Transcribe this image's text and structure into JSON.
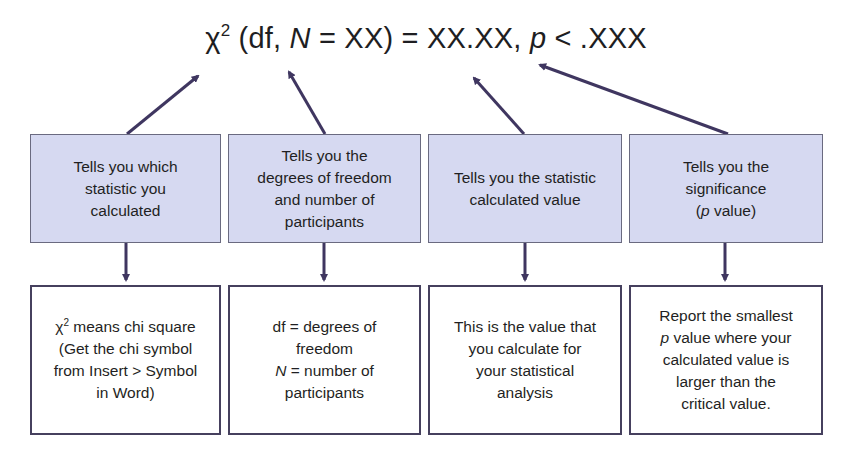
{
  "formula": {
    "chi": "χ",
    "sup": "2",
    "part1": " (df, ",
    "n_var": "N",
    "part2": " = XX) = XX.XX, ",
    "p_var": "p",
    "part3": " < .XXX"
  },
  "colors": {
    "arrow": "#3f3660",
    "top_box_fill": "#d6d9f1",
    "top_box_border": "#6a6a80",
    "bottom_box_border": "#46405e"
  },
  "top_boxes": [
    {
      "text": "Tells you which\nstatistic you\ncalculated"
    },
    {
      "text": "Tells you the\ndegrees of freedom\nand number of\nparticipants"
    },
    {
      "text": "Tells you the statistic\ncalculated value"
    },
    {
      "line1": "Tells you the",
      "line2": "significance",
      "paren_open": "(",
      "p_var": "p",
      "paren_rest": " value)"
    }
  ],
  "bottom_boxes": [
    {
      "chi": "χ",
      "sup": "2",
      "line1_rest": " means chi square",
      "rest": "(Get the chi symbol\nfrom Insert > Symbol\nin Word)"
    },
    {
      "line1": "df = degrees of",
      "line2": "freedom",
      "n_var": "N",
      "line3_rest": " = number of",
      "line4": "participants"
    },
    {
      "text": "This is the value that\nyou calculate for\nyour statistical\nanalysis"
    },
    {
      "line1": "Report the smallest",
      "p_var": "p",
      "line2_rest": " value where your",
      "rest": "calculated value is\nlarger than the\ncritical value."
    }
  ]
}
